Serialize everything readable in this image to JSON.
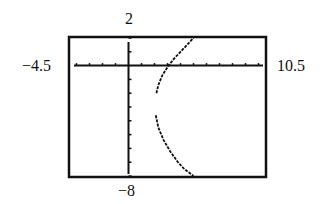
{
  "chart_data": {
    "type": "line",
    "title": "",
    "xlabel": "",
    "ylabel": "",
    "window": {
      "xmin": -4.5,
      "xmax": 10.5,
      "ymin": -8,
      "ymax": 2,
      "xscl": 1,
      "yscl": 1
    },
    "tick_labels": {
      "xmin": "−4.5",
      "xmax": "10.5",
      "ymin": "−8",
      "ymax": "2"
    },
    "grid": false,
    "legend": null,
    "series": [
      {
        "name": "upper branch",
        "points": [
          [
            2.15,
            -2.0
          ],
          [
            2.3,
            -1.4
          ],
          [
            2.6,
            -0.7
          ],
          [
            3.08,
            0.0
          ],
          [
            3.5,
            0.5
          ],
          [
            4.0,
            1.0
          ],
          [
            4.5,
            1.5
          ],
          [
            5.0,
            2.0
          ]
        ]
      },
      {
        "name": "lower branch",
        "points": [
          [
            2.1,
            -3.6
          ],
          [
            2.3,
            -4.5
          ],
          [
            2.7,
            -5.4
          ],
          [
            3.2,
            -6.2
          ],
          [
            3.8,
            -7.0
          ],
          [
            4.3,
            -7.5
          ],
          [
            5.0,
            -8.0
          ]
        ]
      }
    ],
    "colors": {
      "curve": "#111111",
      "axes": "#111111",
      "frame": "#111111"
    }
  }
}
